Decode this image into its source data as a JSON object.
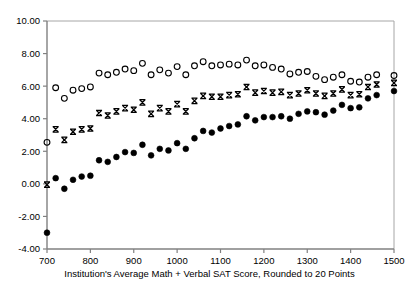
{
  "chart_data": {
    "type": "scatter",
    "title": "",
    "xlabel": "Institution's Average Math + Verbal SAT Score, Rounded to 20 Points",
    "ylabel": "",
    "xlim": [
      700,
      1500
    ],
    "ylim": [
      -4.0,
      10.0
    ],
    "xticks": [
      700,
      800,
      900,
      1000,
      1100,
      1200,
      1300,
      1400,
      1500
    ],
    "xtick_labels": [
      "700",
      "800",
      "900",
      "1000",
      "1100",
      "1200",
      "1300",
      "1400",
      "1500"
    ],
    "yticks": [
      -4.0,
      -2.0,
      0.0,
      2.0,
      4.0,
      6.0,
      8.0,
      10.0
    ],
    "ytick_labels": [
      "-4.00",
      "-2.00",
      "0.00",
      "2.00",
      "4.00",
      "6.00",
      "8.00",
      "10.00"
    ],
    "grid": false,
    "legend": "none",
    "x": [
      700,
      720,
      740,
      760,
      780,
      800,
      820,
      840,
      860,
      880,
      900,
      920,
      940,
      960,
      980,
      1000,
      1020,
      1040,
      1060,
      1080,
      1100,
      1120,
      1140,
      1160,
      1180,
      1200,
      1220,
      1240,
      1260,
      1280,
      1300,
      1320,
      1340,
      1360,
      1380,
      1400,
      1420,
      1440,
      1460,
      1500
    ],
    "series": [
      {
        "name": "open-circle-series",
        "marker": "open-circle",
        "color": "#000000",
        "values": [
          2.55,
          5.9,
          5.25,
          5.75,
          5.85,
          5.95,
          6.8,
          6.7,
          6.85,
          7.05,
          6.95,
          7.4,
          6.7,
          7.0,
          6.8,
          7.2,
          6.7,
          7.25,
          7.5,
          7.25,
          7.3,
          7.35,
          7.3,
          7.6,
          7.25,
          7.3,
          7.15,
          7.05,
          6.75,
          6.85,
          6.9,
          6.6,
          6.4,
          6.55,
          6.7,
          6.3,
          6.25,
          6.55,
          6.7,
          6.65
        ]
      },
      {
        "name": "x-marker-series",
        "marker": "x",
        "color": "#000000",
        "values": [
          -0.05,
          3.35,
          2.7,
          3.2,
          3.35,
          3.4,
          4.35,
          4.2,
          4.45,
          4.65,
          4.55,
          5.0,
          4.3,
          4.65,
          4.45,
          4.9,
          4.45,
          5.1,
          5.4,
          5.35,
          5.35,
          5.45,
          5.5,
          5.95,
          5.6,
          5.7,
          5.6,
          5.65,
          5.45,
          5.55,
          5.75,
          5.55,
          5.4,
          5.55,
          5.8,
          5.45,
          5.5,
          5.95,
          6.1,
          6.2
        ]
      },
      {
        "name": "filled-circle-series",
        "marker": "filled-circle",
        "color": "#000000",
        "values": [
          -3.0,
          0.35,
          -0.3,
          0.25,
          0.45,
          0.5,
          1.45,
          1.35,
          1.65,
          1.95,
          1.9,
          2.4,
          1.75,
          2.15,
          2.05,
          2.5,
          2.15,
          2.8,
          3.25,
          3.15,
          3.4,
          3.55,
          3.65,
          4.15,
          3.9,
          4.1,
          4.1,
          4.15,
          4.0,
          4.3,
          4.45,
          4.4,
          4.25,
          4.5,
          4.85,
          4.65,
          4.7,
          5.25,
          5.45,
          5.7
        ]
      }
    ]
  },
  "axes": {
    "frame_color": "#a6a6a6",
    "axis_color": "#808080",
    "tick_color": "#808080"
  }
}
